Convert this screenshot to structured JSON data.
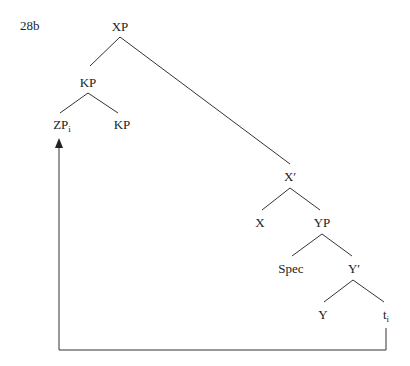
{
  "example_label": "28b",
  "nodes": {
    "xp": "XP",
    "kp_upper": "KP",
    "zp": "ZP",
    "zp_index": "i",
    "kp_lower": "KP",
    "xbar": "X′",
    "x": "X",
    "yp": "YP",
    "spec": "Spec",
    "ybar": "Y′",
    "y": "Y",
    "trace": "t",
    "trace_index": "i"
  },
  "colors": {
    "line": "#333333",
    "text": "#222222"
  }
}
